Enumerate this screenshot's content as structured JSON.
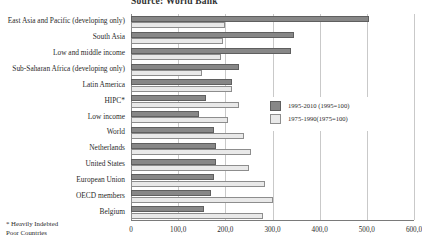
{
  "chart_data": {
    "type": "bar",
    "orientation": "horizontal",
    "title": "Source: World Bank",
    "xlabel": "",
    "ylabel": "",
    "xlim": [
      0,
      600
    ],
    "xticks": [
      "0",
      "100,0",
      "200,0",
      "300,0",
      "400,0",
      "500,0",
      "600,0"
    ],
    "xtick_values": [
      0,
      100,
      200,
      300,
      400,
      500,
      600
    ],
    "grid": true,
    "legend_position": "center-right",
    "categories": [
      "East Asia and Pacific (developing only)",
      "South Asia",
      "Low and middle income",
      "Sub-Saharan Africa (developing only)",
      "Latin America",
      "HIPC*",
      "Low income",
      "World",
      "Netherlands",
      "United States",
      "European Union",
      "OECD members",
      "Belgium"
    ],
    "series": [
      {
        "name": "1995-2010 (1995=100)",
        "color": "#878787",
        "values": [
          505,
          345,
          340,
          230,
          215,
          160,
          145,
          175,
          180,
          180,
          175,
          170,
          155
        ]
      },
      {
        "name": "1975-1990(1975=100)",
        "color": "#e9e9e9",
        "values": [
          200,
          195,
          190,
          150,
          215,
          230,
          205,
          240,
          255,
          250,
          285,
          300,
          280
        ]
      }
    ],
    "annotations": [
      "* Heavily Indebted",
      "Poor Countries"
    ]
  },
  "legend": {
    "items": [
      {
        "label": "1995-2010 (1995=100)",
        "swatch": "recent"
      },
      {
        "label": "1975-1990(1975=100)",
        "swatch": "older"
      }
    ]
  },
  "footnote": {
    "line1": "* Heavily Indebted",
    "line2": "Poor Countries"
  }
}
